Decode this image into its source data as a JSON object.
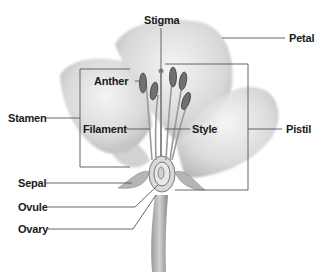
{
  "diagram": {
    "labels": {
      "stigma": "Stigma",
      "petal": "Petal",
      "anther": "Anther",
      "stamen": "Stamen",
      "filament": "Filament",
      "style": "Style",
      "pistil": "Pistil",
      "sepal": "Sepal",
      "ovule": "Ovule",
      "ovary": "Ovary"
    },
    "groups": {
      "stamen_bracket": [
        "Anther",
        "Filament"
      ],
      "pistil_bracket": [
        "Stigma",
        "Style",
        "Ovary"
      ]
    },
    "colors": {
      "label_text": "#1a1a1a",
      "leader_line": "#555555",
      "petal_shade": "#bdbdbd",
      "anther": "#6a6a6a"
    }
  }
}
